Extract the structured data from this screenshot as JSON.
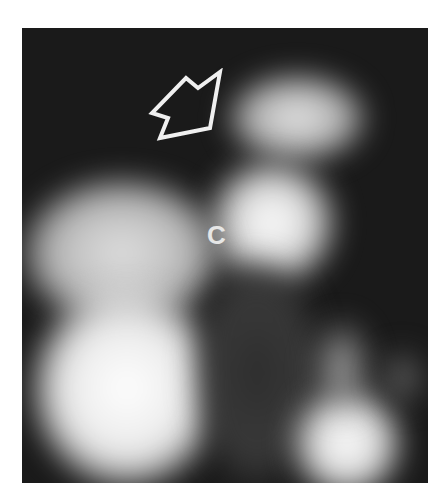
{
  "image": {
    "kind": "grayscale nuclear scan",
    "annotation_label": "C",
    "annotation_arrow": "outlined arrow pointing down-left toward upper bright region",
    "colors": {
      "background": "#1a1a1a",
      "hot": "#ffffff",
      "border": "#ffffff"
    }
  }
}
